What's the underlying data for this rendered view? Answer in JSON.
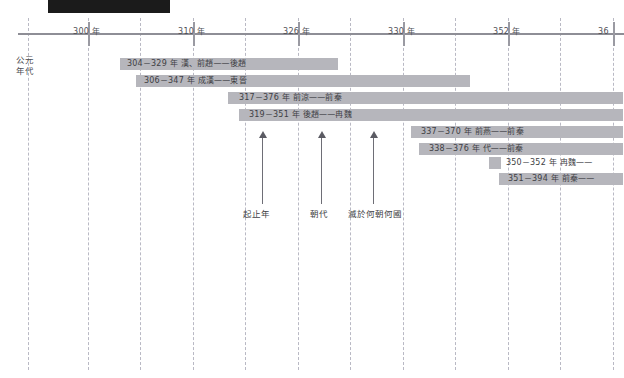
{
  "header": {
    "block_color": "#1b1b1b"
  },
  "axis": {
    "caption": "公元\n年代",
    "ticks": [
      {
        "label": "300 年",
        "x": 88
      },
      {
        "label": "310 年",
        "x": 193
      },
      {
        "label": "326 年",
        "x": 298
      },
      {
        "label": "330 年",
        "x": 403
      },
      {
        "label": "352 年",
        "x": 508
      },
      {
        "label": "36",
        "x": 613
      }
    ],
    "line_color": "#8e8e96"
  },
  "gridlines": [
    28,
    88,
    140,
    193,
    245,
    298,
    350,
    403,
    455,
    508,
    560,
    613
  ],
  "chart_data": {
    "type": "bar",
    "title": "",
    "xlabel": "公元年代",
    "ylabel": "",
    "orientation": "horizontal-gantt",
    "grid": true,
    "xlim": [
      296,
      400
    ],
    "tick_labels": [
      "300 年",
      "310 年",
      "326 年",
      "330 年",
      "352 年",
      "36"
    ],
    "bars": [
      {
        "label": "304－329 年  漢、前趙——後趙",
        "start_year": 304,
        "end_year": 329,
        "dynasty": "漢、前趙",
        "conquered_by": "後趙",
        "x": 120,
        "y": 58,
        "width": 218,
        "text_x": 127
      },
      {
        "label": "306－347 年  成漢——東晉",
        "start_year": 306,
        "end_year": 347,
        "dynasty": "成漢",
        "conquered_by": "東晉",
        "x": 136,
        "y": 75,
        "width": 334,
        "text_x": 144
      },
      {
        "label": "317－376 年  前涼——前秦",
        "start_year": 317,
        "end_year": 376,
        "dynasty": "前涼",
        "conquered_by": "前秦",
        "x": 228,
        "y": 92,
        "width": 395,
        "text_x": 239
      },
      {
        "label": "319－351 年  後趙——冉魏",
        "start_year": 319,
        "end_year": 351,
        "dynasty": "後趙",
        "conquered_by": "冉魏",
        "x": 239,
        "y": 109,
        "width": 384,
        "text_x": 249
      },
      {
        "label": "337－370 年  前燕——前秦",
        "start_year": 337,
        "end_year": 370,
        "dynasty": "前燕",
        "conquered_by": "前秦",
        "x": 411,
        "y": 126,
        "width": 212,
        "text_x": 421
      },
      {
        "label": "338－376 年  代——前秦",
        "start_year": 338,
        "end_year": 376,
        "dynasty": "代",
        "conquered_by": "前秦",
        "x": 419,
        "y": 143,
        "width": 204,
        "text_x": 429
      },
      {
        "label": "350－352 年  冉魏——",
        "start_year": 350,
        "end_year": 352,
        "dynasty": "冉魏",
        "conquered_by": "",
        "x": 489,
        "y": 157,
        "width": 12,
        "text_x": 506
      },
      {
        "label": "351－394 年  前秦——",
        "start_year": 351,
        "end_year": 394,
        "dynasty": "前秦",
        "conquered_by": "",
        "x": 499,
        "y": 173,
        "width": 124,
        "text_x": 508
      }
    ],
    "annotations": [
      {
        "label": "起止年",
        "x": 262,
        "label_x": 243,
        "top": 131,
        "bottom": 204
      },
      {
        "label": "朝代",
        "x": 321,
        "label_x": 310,
        "top": 131,
        "bottom": 204
      },
      {
        "label": "滅於何朝何國",
        "x": 373,
        "label_x": 348,
        "top": 131,
        "bottom": 204
      }
    ]
  }
}
